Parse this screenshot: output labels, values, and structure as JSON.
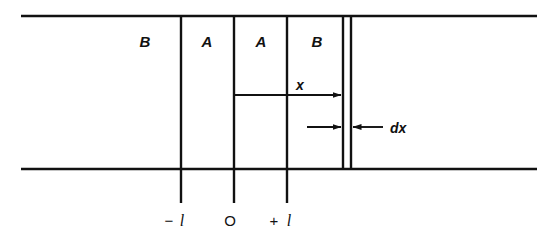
{
  "figure": {
    "background_color": "#ffffff",
    "ink_color": "#111111"
  },
  "regions": [
    {
      "name": "region-b-left",
      "label": "B",
      "x": 145,
      "y": 47
    },
    {
      "name": "region-a-left",
      "label": "A",
      "x": 207,
      "y": 47
    },
    {
      "name": "region-a-right",
      "label": "A",
      "x": 261,
      "y": 47
    },
    {
      "name": "region-b-right",
      "label": "B",
      "x": 317,
      "y": 47
    }
  ],
  "boundaries": {
    "top_line": {
      "x1": 21,
      "y1": 16,
      "x2": 537,
      "y2": 16
    },
    "bottom_line": {
      "x1": 21,
      "y1": 169,
      "x2": 537,
      "y2": 169
    }
  },
  "verticals": [
    {
      "name": "wall-minus-l",
      "x": 181,
      "y_top": 16,
      "y_bottom": 203
    },
    {
      "name": "wall-zero",
      "x": 234,
      "y_top": 16,
      "y_bottom": 203
    },
    {
      "name": "wall-plus-l",
      "x": 287,
      "y_top": 16,
      "y_bottom": 203
    },
    {
      "name": "dx-strip-left",
      "x": 343,
      "y_top": 16,
      "y_bottom": 169
    },
    {
      "name": "dx-strip-right",
      "x": 351,
      "y_top": 16,
      "y_bottom": 169
    }
  ],
  "measurements": {
    "x_arrow": {
      "label": "x",
      "label_x": 300,
      "label_y": 90,
      "from_x": 234,
      "to_x": 343,
      "y": 95
    },
    "dx_arrow": {
      "label": "dx",
      "label_x": 390,
      "label_y": 133,
      "y": 127,
      "left_arrow_from_x": 307,
      "left_arrow_to_x": 343,
      "right_arrow_from_x": 383,
      "right_arrow_to_x": 351
    }
  },
  "axis_ticks": [
    {
      "name": "tick-minus-l",
      "sign": "−",
      "symbol": "l",
      "sign_x": 169,
      "symbol_x": 182,
      "y": 226
    },
    {
      "name": "tick-zero",
      "sign": "",
      "symbol": "O",
      "sign_x": 0,
      "symbol_x": 228,
      "y": 226
    },
    {
      "name": "tick-plus-l",
      "sign": "+",
      "symbol": "l",
      "sign_x": 272,
      "symbol_x": 288,
      "y": 226
    }
  ]
}
